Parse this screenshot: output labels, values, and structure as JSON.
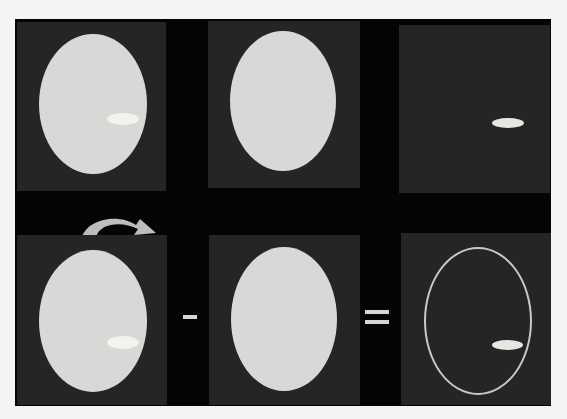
{
  "figure": {
    "rows": [
      {
        "name": "top-row",
        "panels": [
          "image-with-lesion",
          "baseline-image",
          "lesion-only"
        ]
      },
      {
        "name": "bottom-row",
        "panels": [
          "image-with-lesion",
          "baseline-image",
          "difference-with-ring-artifact"
        ]
      }
    ],
    "operators": {
      "minus": "-",
      "equals": "="
    },
    "arrow": "curved-arrow-right",
    "colors": {
      "background": "#050505",
      "panel": "#252525",
      "phantom": "#d8d8d6",
      "lesion": "#f2f2ef",
      "page": "#f4f4f2"
    }
  }
}
